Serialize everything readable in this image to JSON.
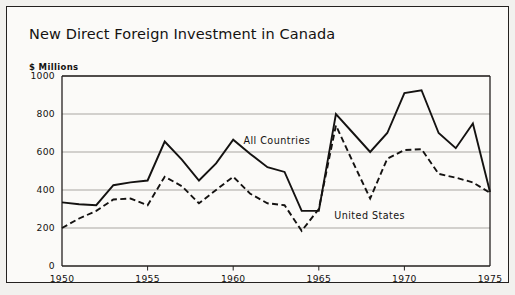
{
  "figure": {
    "background_color": "#f2f1ee",
    "panel_color": "#fbfaf8",
    "border_color": "#24211f"
  },
  "chart_data": {
    "type": "line",
    "title": "New Direct Foreign Investment in Canada",
    "subtitle": "",
    "ylabel": "$ Millions",
    "xlabel": "",
    "xlim": [
      1950,
      1975
    ],
    "ylim": [
      0,
      1000
    ],
    "grid": true,
    "grid_axis": "y",
    "legend_position": "inline-annotation",
    "yticks": [
      0,
      200,
      400,
      600,
      800,
      1000
    ],
    "ytick_labels": [
      "0",
      "200",
      "400",
      "600",
      "800",
      "1000"
    ],
    "xticks": [
      1950,
      1955,
      1960,
      1965,
      1970,
      1975
    ],
    "xtick_labels": [
      "1950",
      "1955",
      "1960",
      "1965",
      "1970",
      "1975"
    ],
    "x": [
      1950,
      1951,
      1952,
      1953,
      1954,
      1955,
      1956,
      1957,
      1958,
      1959,
      1960,
      1961,
      1962,
      1963,
      1964,
      1965,
      1966,
      1967,
      1968,
      1969,
      1970,
      1971,
      1972,
      1973,
      1974,
      1975
    ],
    "series": [
      {
        "name": "All Countries",
        "line_style": "solid",
        "color": "#141211",
        "label_text": "All  Countries",
        "values": [
          335,
          325,
          320,
          425,
          440,
          450,
          655,
          560,
          450,
          540,
          665,
          590,
          520,
          495,
          290,
          290,
          800,
          700,
          600,
          700,
          910,
          925,
          700,
          620,
          750,
          390
        ]
      },
      {
        "name": "United States",
        "line_style": "dashed",
        "color": "#141211",
        "label_text": "United States",
        "values": [
          200,
          250,
          290,
          350,
          355,
          320,
          470,
          420,
          330,
          400,
          470,
          380,
          330,
          320,
          185,
          300,
          740,
          545,
          355,
          565,
          610,
          615,
          485,
          465,
          440,
          385
        ]
      }
    ],
    "annotations": [
      {
        "text": "All  Countries",
        "x": 1960.6,
        "y": 640
      },
      {
        "text": "United States",
        "x": 1965.9,
        "y": 245
      }
    ]
  }
}
